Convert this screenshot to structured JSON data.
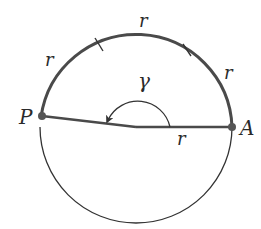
{
  "diagram": {
    "title": "",
    "colors": {
      "stroke_thick": "#4a4a4a",
      "stroke_thin": "#333333",
      "point": "#555555",
      "text": "#2a2a2a",
      "background": "#ffffff"
    },
    "circle": {
      "cx": 136,
      "cy": 127,
      "r": 96
    },
    "points": [
      {
        "id": "P",
        "label": "P",
        "x": 42,
        "y": 116
      },
      {
        "id": "A",
        "label": "A",
        "x": 232,
        "y": 127
      }
    ],
    "arc_labels": [
      {
        "id": "arc1",
        "label": "r"
      },
      {
        "id": "arc2",
        "label": "r"
      },
      {
        "id": "arc3",
        "label": "r"
      }
    ],
    "radius_label": "r",
    "angle_label": "γ"
  }
}
